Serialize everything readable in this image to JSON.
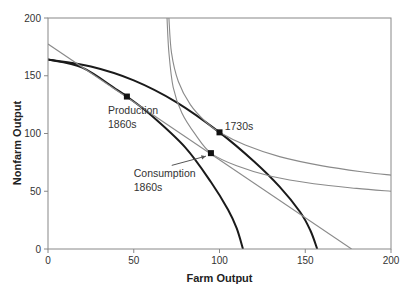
{
  "chart_data": {
    "type": "line",
    "title": "",
    "xlabel": "Farm Output",
    "ylabel": "Nonfarm Output",
    "xlim": [
      0,
      200
    ],
    "ylim": [
      0,
      200
    ],
    "x_ticks": [
      0,
      50,
      100,
      150,
      200
    ],
    "y_ticks": [
      0,
      50,
      100,
      150,
      200
    ],
    "grid": false,
    "legend": null,
    "series": [
      {
        "name": "Production possibilities frontier (inner, 1860s)",
        "style": "thick-dark",
        "points": [
          [
            0,
            164
          ],
          [
            20,
            157
          ],
          [
            40,
            138
          ],
          [
            46,
            132
          ],
          [
            60,
            116
          ],
          [
            80,
            88
          ],
          [
            95,
            58
          ],
          [
            105,
            34
          ],
          [
            110,
            18
          ],
          [
            113.7,
            0
          ]
        ]
      },
      {
        "name": "Production possibilities frontier (outer, 1730s)",
        "style": "thick-dark",
        "points": [
          [
            0,
            164
          ],
          [
            25,
            158
          ],
          [
            50,
            146
          ],
          [
            75,
            127
          ],
          [
            100,
            101
          ],
          [
            120,
            76
          ],
          [
            135,
            54
          ],
          [
            147,
            32
          ],
          [
            153,
            16
          ],
          [
            157,
            0
          ]
        ]
      },
      {
        "name": "Price line (trade)",
        "style": "thin-gray",
        "points": [
          [
            0,
            177.5
          ],
          [
            177,
            0
          ]
        ]
      },
      {
        "name": "Indifference curve (upper)",
        "style": "thin-gray",
        "points": [
          [
            70.5,
            200
          ],
          [
            72,
            170
          ],
          [
            76,
            145
          ],
          [
            83,
            125
          ],
          [
            92,
            110
          ],
          [
            100,
            101
          ],
          [
            115,
            90
          ],
          [
            135,
            80
          ],
          [
            160,
            72
          ],
          [
            185,
            66.5
          ],
          [
            200,
            64
          ]
        ]
      },
      {
        "name": "Indifference curve (lower)",
        "style": "thin-gray",
        "points": [
          [
            69.4,
            200
          ],
          [
            70.5,
            170
          ],
          [
            73,
            140
          ],
          [
            78,
            118
          ],
          [
            86,
            99
          ],
          [
            95,
            83
          ],
          [
            110,
            72
          ],
          [
            130,
            63
          ],
          [
            155,
            56.5
          ],
          [
            180,
            52.5
          ],
          [
            200,
            50
          ]
        ]
      }
    ],
    "points": [
      {
        "label": "1730s",
        "x": 100,
        "y": 101
      },
      {
        "label": "Production 1860s",
        "x": 46,
        "y": 132
      },
      {
        "label": "Consumption 1860s",
        "x": 95,
        "y": 83
      }
    ],
    "annotations": [
      {
        "text": [
          "Production",
          "1860s"
        ],
        "anchor": {
          "x": 35,
          "y": 117
        },
        "arrow": false
      },
      {
        "text": [
          "1730s"
        ],
        "anchor": {
          "x": 103,
          "y": 103
        },
        "arrow": false
      },
      {
        "text": [
          "Consumption",
          "1860s"
        ],
        "anchor": {
          "x": 50,
          "y": 62
        },
        "arrow_to": {
          "x": 95,
          "y": 83
        }
      }
    ]
  },
  "colors": {
    "frontier": "#1a1a1a",
    "thin_line": "#8a8a8a",
    "axis": "#888888",
    "marker": "#111111",
    "text": "#333333"
  }
}
